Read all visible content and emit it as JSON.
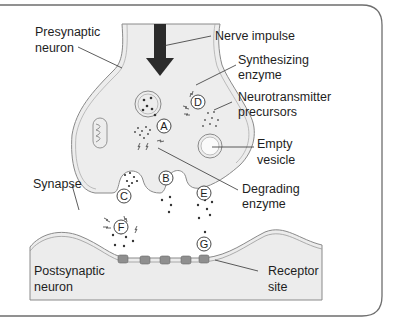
{
  "diagram": {
    "labels": {
      "presynaptic_neuron": [
        "Presynaptic",
        "neuron"
      ],
      "nerve_impulse": "Nerve impulse",
      "synthesizing_enzyme": [
        "Synthesizing",
        "enzyme"
      ],
      "neurotransmitter_precursors": [
        "Neurotransmitter",
        "precursors"
      ],
      "empty_vesicle": [
        "Empty",
        "vesicle"
      ],
      "synapse": "Synapse",
      "degrading_enzyme": [
        "Degrading",
        "enzyme"
      ],
      "postsynaptic_neuron": [
        "Postsynaptic",
        "neuron"
      ],
      "receptor_site": [
        "Receptor",
        "site"
      ]
    },
    "steps": [
      "A",
      "B",
      "C",
      "D",
      "E",
      "F",
      "G"
    ],
    "colors": {
      "cell_fill": "#ededed",
      "membrane": "#8a8a8a",
      "arrow": "#2b2b2b",
      "text": "#1e1e1e",
      "frame": "#6e6e6e",
      "receptor": "#8f8f8f"
    }
  }
}
